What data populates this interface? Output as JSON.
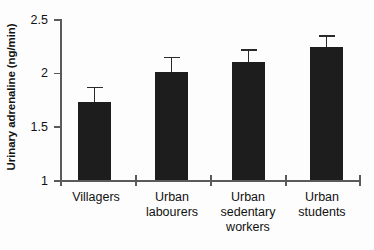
{
  "chart_data": {
    "type": "bar",
    "title": "",
    "subtitle": "",
    "xlabel": "",
    "ylabel": "Urinary adrenaline (ng/min)",
    "categories": [
      "Villagers",
      "Urban labourers",
      "Urban sedentary workers",
      "Urban students"
    ],
    "category_lines": [
      [
        "Villagers"
      ],
      [
        "Urban",
        "labourers"
      ],
      [
        "Urban",
        "sedentary",
        "workers"
      ],
      [
        "Urban",
        "students"
      ]
    ],
    "values": [
      1.73,
      2.01,
      2.1,
      2.24
    ],
    "errors": [
      0.14,
      0.14,
      0.12,
      0.11
    ],
    "ylim": [
      1,
      2.5
    ],
    "yticks": [
      1,
      1.5,
      2,
      2.5
    ],
    "ytick_labels": [
      "1",
      "1.5",
      "2",
      "2.5"
    ],
    "grid": false,
    "legend": false,
    "legend_position": "none",
    "bar_color": "#1d1d1d",
    "error_bar_color": "#2a2a2a",
    "axis_color": "#5a5a5a",
    "background_color": "#fdfdfd"
  }
}
